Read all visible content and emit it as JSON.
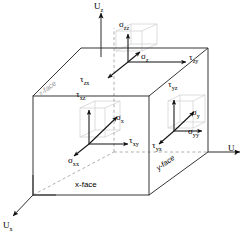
{
  "figure": {
    "background_color": "#ffffff",
    "line_color": "#1a1a1a",
    "faint_line_color": "#c8c8c8",
    "dashed_line_color": "#9a9a9a"
  },
  "axes": [
    {
      "name": "axis-uz",
      "label": "U",
      "sub": "z",
      "direction": "up"
    },
    {
      "name": "axis-uy",
      "label": "U",
      "sub": "y",
      "direction": "right"
    },
    {
      "name": "axis-ux",
      "label": "U",
      "sub": "x",
      "direction": "down-left"
    }
  ],
  "face_labels": [
    {
      "name": "x-face-label",
      "text": "x-face",
      "style": "upright"
    },
    {
      "name": "y-face-label",
      "text": "y-face",
      "style": "italic-rotated"
    },
    {
      "name": "z-face-label",
      "text": "z-face",
      "style": "italic-rotated-faint"
    }
  ],
  "stress_components": {
    "z_face": [
      {
        "name": "sigma-zz",
        "symbol": "σ",
        "sub": "zz",
        "direction": "up"
      },
      {
        "name": "sigma-z",
        "symbol": "σ",
        "sub": "z",
        "direction": "diagonal-up-right"
      },
      {
        "name": "tau-zy",
        "symbol": "τ",
        "sub": "zy",
        "direction": "right"
      },
      {
        "name": "tau-zx",
        "symbol": "τ",
        "sub": "zx",
        "direction": "down-left"
      }
    ],
    "x_face": [
      {
        "name": "tau-xz",
        "symbol": "τ",
        "sub": "xz",
        "direction": "up"
      },
      {
        "name": "sigma-x",
        "symbol": "σ",
        "sub": "x",
        "direction": "diagonal-up-right"
      },
      {
        "name": "tau-xy",
        "symbol": "τ",
        "sub": "xy",
        "direction": "right"
      },
      {
        "name": "sigma-xx",
        "symbol": "σ",
        "sub": "xx",
        "direction": "down-left"
      }
    ],
    "y_face": [
      {
        "name": "tau-yz",
        "symbol": "τ",
        "sub": "yz",
        "direction": "up"
      },
      {
        "name": "sigma-y",
        "symbol": "σ",
        "sub": "y",
        "direction": "diagonal-up-right"
      },
      {
        "name": "sigma-yy",
        "symbol": "σ",
        "sub": "yy",
        "direction": "right"
      },
      {
        "name": "tau-yx",
        "symbol": "τ",
        "sub": "yx",
        "direction": "down-left"
      }
    ]
  },
  "labels": {
    "uz_main": "U",
    "uz_sub": "z",
    "uy_main": "U",
    "uy_sub": "y",
    "ux_main": "U",
    "ux_sub": "x",
    "sigma_zz_main": "σ",
    "sigma_zz_sub": "zz",
    "sigma_z_main": "σ",
    "sigma_z_sub": "z",
    "tau_zy_main": "τ",
    "tau_zy_sub": "zy",
    "tau_zx_main": "τ",
    "tau_zx_sub": "zx",
    "tau_xz_main": "τ",
    "tau_xz_sub": "xz",
    "sigma_x_main": "σ",
    "sigma_x_sub": "x",
    "tau_xy_main": "τ",
    "tau_xy_sub": "xy",
    "sigma_xx_main": "σ",
    "sigma_xx_sub": "xx",
    "tau_yz_main": "τ",
    "tau_yz_sub": "yz",
    "sigma_y_main": "σ",
    "sigma_y_sub": "y",
    "sigma_yy_main": "σ",
    "sigma_yy_sub": "yy",
    "tau_yx_main": "τ",
    "tau_yx_sub": "yx",
    "x_face": "x-face",
    "y_face": "y-face",
    "z_face": "z-face"
  }
}
